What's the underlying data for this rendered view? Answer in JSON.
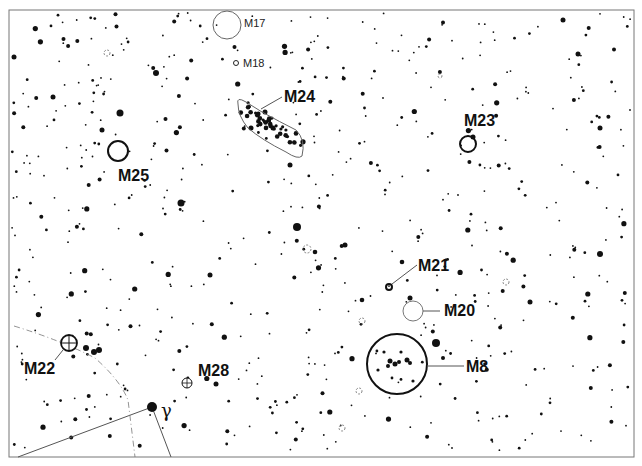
{
  "map": {
    "frame": {
      "x": 9,
      "y": 10,
      "w": 625,
      "h": 447
    },
    "colors": {
      "ink": "#111111",
      "line": "#555555",
      "frame": "#777777",
      "background": "#ffffff"
    }
  },
  "objects": [
    {
      "id": "M17",
      "label": "M17",
      "type": "nebula",
      "cx": 227,
      "cy": 25,
      "r": 14,
      "label_x": 244,
      "label_y": 27,
      "size": "small"
    },
    {
      "id": "M18",
      "label": "M18",
      "type": "open-cluster-small",
      "cx": 236,
      "cy": 63,
      "r": 3,
      "label_x": 243,
      "label_y": 67,
      "size": "small"
    },
    {
      "id": "M24",
      "label": "M24",
      "type": "star-cloud",
      "label_x": 284,
      "label_y": 102,
      "size": "large"
    },
    {
      "id": "M25",
      "label": "M25",
      "type": "open-cluster",
      "cx": 118,
      "cy": 151,
      "r": 10,
      "label_x": 118,
      "label_y": 181,
      "size": "large"
    },
    {
      "id": "M23",
      "label": "M23",
      "type": "open-cluster",
      "cx": 468,
      "cy": 144,
      "r": 8,
      "label_x": 464,
      "label_y": 126,
      "size": "large"
    },
    {
      "id": "M21",
      "label": "M21",
      "type": "open-cluster-small",
      "cx": 389,
      "cy": 287,
      "r": 3,
      "label_x": 418,
      "label_y": 271,
      "size": "large"
    },
    {
      "id": "M20",
      "label": "M20",
      "type": "nebula",
      "cx": 413,
      "cy": 311,
      "r": 10,
      "label_x": 444,
      "label_y": 316,
      "size": "large"
    },
    {
      "id": "M8",
      "label": "M8",
      "type": "nebula",
      "cx": 397,
      "cy": 364,
      "r": 30,
      "label_x": 466,
      "label_y": 372,
      "size": "large"
    },
    {
      "id": "M22",
      "label": "M22",
      "type": "globular",
      "cx": 69,
      "cy": 343,
      "r": 8,
      "label_x": 24,
      "label_y": 374,
      "size": "large"
    },
    {
      "id": "M28",
      "label": "M28",
      "type": "globular",
      "cx": 187,
      "cy": 383,
      "r": 5,
      "label_x": 198,
      "label_y": 376,
      "size": "large"
    }
  ],
  "named_stars": [
    {
      "id": "gamma-sgr",
      "label": "γ",
      "cx": 152,
      "cy": 407,
      "r": 5,
      "label_x": 161,
      "label_y": 417
    }
  ],
  "stars_seed": 7,
  "stars_count": 620,
  "bright_stars": [
    [
      120,
      113,
      3.5
    ],
    [
      181,
      203,
      3.5
    ],
    [
      297,
      227,
      4
    ],
    [
      436,
      343,
      4
    ],
    [
      600,
      254,
      3
    ],
    [
      156,
      73,
      3
    ],
    [
      102,
      130,
      2.5
    ],
    [
      53,
      97,
      2.5
    ],
    [
      14,
      57,
      2.5
    ],
    [
      99,
      350,
      3
    ],
    [
      216,
      384,
      2.5
    ],
    [
      345,
      245,
      2.5
    ],
    [
      410,
      298,
      2.5
    ],
    [
      290,
      165,
      2.5
    ],
    [
      265,
      112,
      2.5
    ],
    [
      273,
      128,
      2.5
    ],
    [
      251,
      128,
      2.5
    ],
    [
      473,
      137,
      2.5
    ],
    [
      600,
      128,
      2.5
    ],
    [
      563,
      20,
      2.5
    ],
    [
      578,
      54,
      2.5
    ],
    [
      210,
      275,
      2.5
    ],
    [
      530,
      302,
      2.5
    ],
    [
      402,
      262,
      2.3
    ],
    [
      86,
      348,
      3
    ],
    [
      94,
      352,
      3
    ],
    [
      362,
      300,
      2.3
    ],
    [
      315,
      252,
      2.3
    ]
  ]
}
